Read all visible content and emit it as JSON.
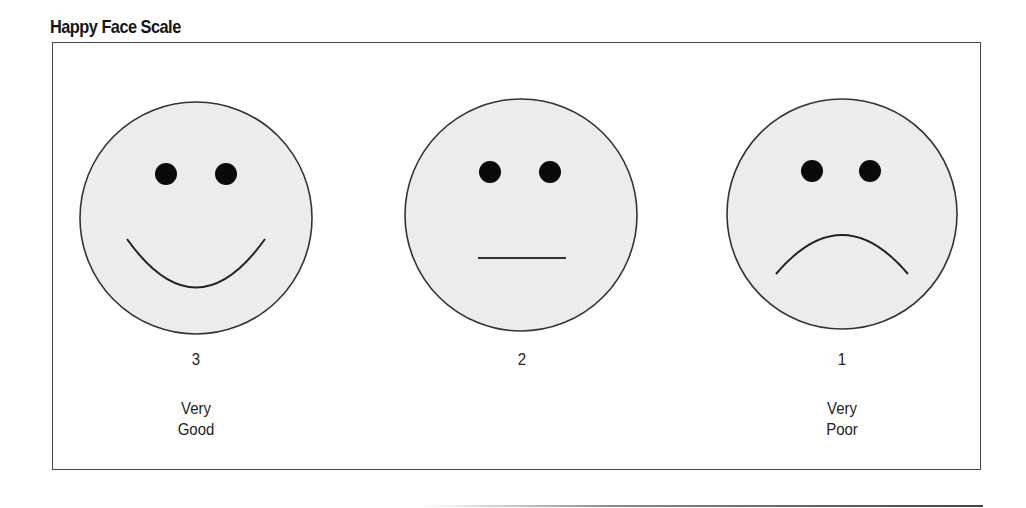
{
  "title": "Happy Face Scale",
  "colors": {
    "face_fill": "#ececec",
    "face_stroke": "#333333",
    "eye_fill": "#0a0a0a",
    "frame_border": "#444444"
  },
  "faces": [
    {
      "id": "very-good",
      "expression": "smile",
      "score": "3",
      "description_line1": "Very",
      "description_line2": "Good"
    },
    {
      "id": "neutral",
      "expression": "neutral",
      "score": "2",
      "description_line1": "",
      "description_line2": ""
    },
    {
      "id": "very-poor",
      "expression": "frown",
      "score": "1",
      "description_line1": "Very",
      "description_line2": "Poor"
    }
  ]
}
